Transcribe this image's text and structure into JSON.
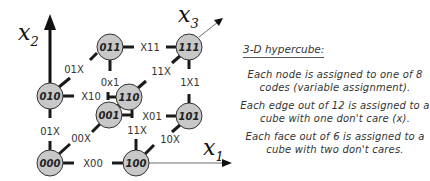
{
  "diagram": {
    "axes": {
      "x1": {
        "label": "x",
        "sub": "1"
      },
      "x2": {
        "label": "x",
        "sub": "2"
      },
      "x3": {
        "label": "x",
        "sub": "3"
      }
    },
    "nodes": [
      {
        "id": "000",
        "label": "000"
      },
      {
        "id": "100",
        "label": "100"
      },
      {
        "id": "010",
        "label": "010"
      },
      {
        "id": "110",
        "label": "110"
      },
      {
        "id": "001",
        "label": "001"
      },
      {
        "id": "101",
        "label": "101"
      },
      {
        "id": "011",
        "label": "011"
      },
      {
        "id": "111",
        "label": "111"
      }
    ],
    "edges": [
      {
        "from": "000",
        "to": "100",
        "label": "X00"
      },
      {
        "from": "000",
        "to": "010",
        "label": "01X"
      },
      {
        "from": "000",
        "to": "001",
        "label": "00X"
      },
      {
        "from": "100",
        "to": "110",
        "label": "11X"
      },
      {
        "from": "100",
        "to": "101",
        "label": "10X"
      },
      {
        "from": "010",
        "to": "110",
        "label": "X10"
      },
      {
        "from": "010",
        "to": "011",
        "label": "01X"
      },
      {
        "from": "110",
        "to": "111",
        "label": "11X"
      },
      {
        "from": "001",
        "to": "101",
        "label": "X01"
      },
      {
        "from": "001",
        "to": "011",
        "label": "0x1"
      },
      {
        "from": "101",
        "to": "111",
        "label": "1X1"
      },
      {
        "from": "011",
        "to": "111",
        "label": "X11"
      }
    ],
    "colors": {
      "node_fill": "#c8c8c8",
      "node_stroke": "#333333",
      "edge": "#1a1a1a",
      "axis": "#111111"
    }
  },
  "notes": {
    "title": "3-D hypercube:",
    "paragraphs": [
      "Each node is assigned to one of 8 codes (variable assignment).",
      "Each edge out of 12 is assigned to a cube with one don't care (x).",
      "Each face out of 6 is assigned to a cube with two don't cares."
    ]
  }
}
